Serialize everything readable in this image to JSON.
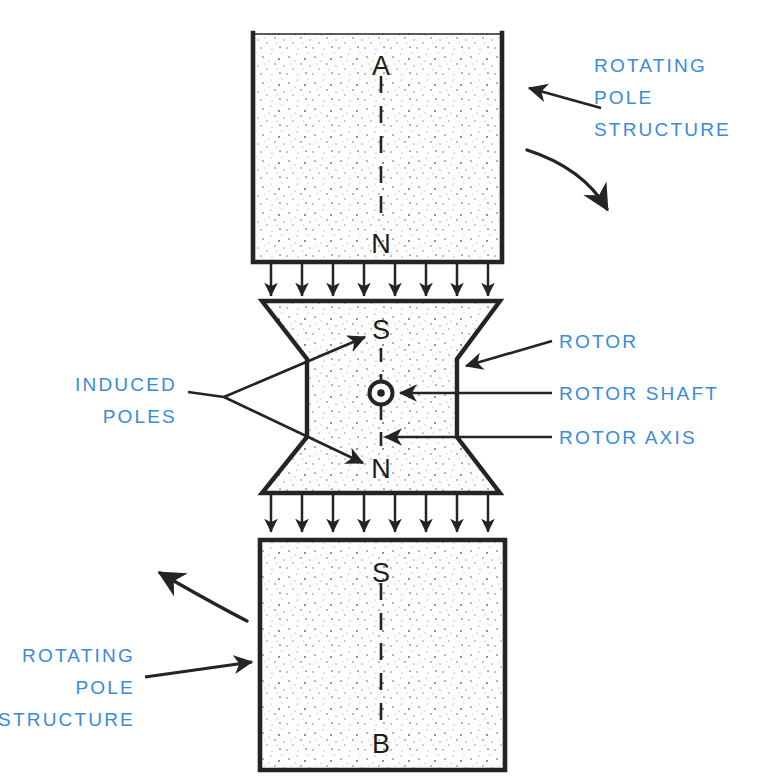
{
  "figure": {
    "background_color": "#ffffff",
    "ink_color": "#242424",
    "label_color": "#3a8bd8"
  },
  "pole_letters": {
    "top_block_top": "A",
    "top_block_bottom": "N",
    "rotor_top": "S",
    "rotor_bottom": "N",
    "bottom_block_top": "S",
    "bottom_block_bottom": "B"
  },
  "labels": {
    "top_right": {
      "line1": "ROTATING",
      "line2": "POLE",
      "line3": "STRUCTURE"
    },
    "bottom_left": {
      "line1": "ROTATING",
      "line2": "POLE",
      "line3": "STRUCTURE"
    },
    "left_middle": {
      "line1": "INDUCED",
      "line2": "POLES"
    },
    "right_rotor": "ROTOR",
    "right_rotor_shaft": "ROTOR SHAFT",
    "right_rotor_axis": "ROTOR AXIS"
  },
  "flux_arrows": {
    "upper_gap_count": 8,
    "lower_gap_count": 8
  },
  "icons": {
    "shaft": "rotor-shaft-out-of-page-icon",
    "rotation_top": "rotation-arrow-clockwise-icon",
    "rotation_bottom": "rotation-arrow-counterclockwise-icon"
  }
}
